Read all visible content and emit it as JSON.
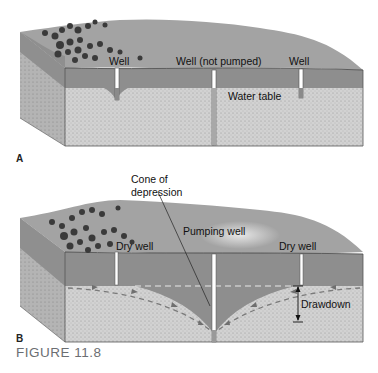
{
  "figure": {
    "caption": "FIGURE 11.8",
    "colors": {
      "surface": "#9a9a9a",
      "unsaturated_zone": "#8d8d8d",
      "aquifer": "#cfcfcf",
      "side_face": "#b0b0b0",
      "well": "#ffffff",
      "trees": "#3c3c3c",
      "flow_arrows": "#7a7a7a"
    }
  },
  "panel_a": {
    "letter": "A",
    "labels": {
      "well_left": "Well",
      "well_center": "Well (not pumped)",
      "well_right": "Well",
      "water_table": "Water table"
    }
  },
  "panel_b": {
    "letter": "B",
    "labels": {
      "cone": "Cone of\ndepression",
      "cone_line1": "Cone of",
      "cone_line2": "depression",
      "pumping_well": "Pumping well",
      "dry_well_left": "Dry well",
      "dry_well_right": "Dry well",
      "drawdown": "Drawdown"
    }
  }
}
